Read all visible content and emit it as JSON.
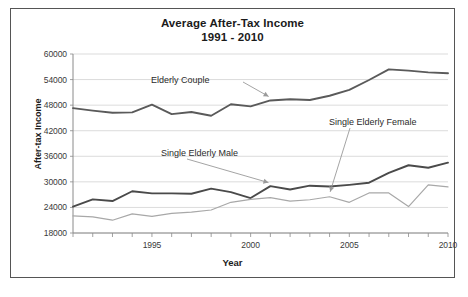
{
  "chart_data": {
    "type": "line",
    "title": "Average After-Tax Income",
    "subtitle": "1991 - 2010",
    "xlabel": "Year",
    "ylabel": "After-tax Income",
    "grid": true,
    "legend_position": "inline-annotations",
    "xlim": [
      1991,
      2010
    ],
    "ylim": [
      18000,
      60000
    ],
    "yticks": [
      18000,
      24000,
      30000,
      36000,
      42000,
      48000,
      54000,
      60000
    ],
    "ytick_labels": [
      "18000",
      "24000",
      "30000",
      "36000",
      "42000",
      "48000",
      "54000",
      "60000"
    ],
    "xticks": [
      1991,
      1992,
      1993,
      1994,
      1995,
      1996,
      1997,
      1998,
      1999,
      2000,
      2001,
      2002,
      2003,
      2004,
      2005,
      2006,
      2007,
      2008,
      2009,
      2010
    ],
    "xtick_labels_shown": [
      "1995",
      "2000",
      "2005",
      "2010"
    ],
    "x": [
      1991,
      1992,
      1993,
      1994,
      1995,
      1996,
      1997,
      1998,
      1999,
      2000,
      2001,
      2002,
      2003,
      2004,
      2005,
      2006,
      2007,
      2008,
      2009,
      2010
    ],
    "series": [
      {
        "name": "Elderly Couple",
        "color": "#5a5a5a",
        "values": [
          47300,
          46700,
          46200,
          46300,
          48100,
          45900,
          46400,
          45500,
          48200,
          47700,
          49100,
          49400,
          49200,
          50200,
          51600,
          53900,
          56400,
          56100,
          55700,
          55500
        ]
      },
      {
        "name": "Single Elderly Male",
        "color": "#4a4a4a",
        "values": [
          24200,
          25900,
          25500,
          27800,
          27300,
          27300,
          27200,
          28400,
          27600,
          26200,
          29000,
          28200,
          29100,
          28900,
          29300,
          29800,
          32100,
          33900,
          33300,
          34500
        ]
      },
      {
        "name": "Single Elderly Female",
        "color": "#a8a8a8",
        "values": [
          22000,
          21800,
          21000,
          22500,
          21900,
          22600,
          22900,
          23400,
          25200,
          25900,
          26300,
          25500,
          25800,
          26500,
          25200,
          27400,
          27400,
          24200,
          29300,
          28800
        ]
      }
    ],
    "annotations": [
      {
        "label": "Elderly Couple",
        "points_to_year": 2001,
        "points_to_value": 49100
      },
      {
        "label": "Single Elderly Male",
        "points_to_year": 2001,
        "points_to_value": 29000
      },
      {
        "label": "Single Elderly Female",
        "points_to_year": 2004,
        "points_to_value": 26500
      }
    ]
  }
}
